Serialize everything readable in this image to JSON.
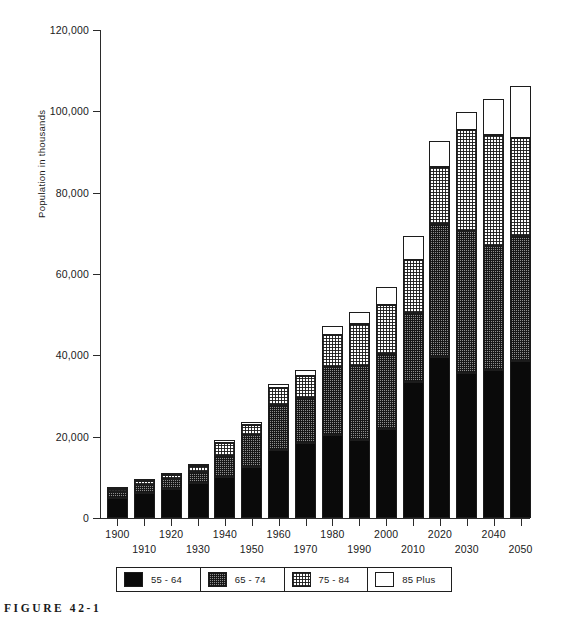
{
  "figure": {
    "caption": "FIGURE 42-1"
  },
  "chart_data": {
    "type": "bar",
    "subtype": "stacked-vertical",
    "title": "",
    "xlabel": "",
    "ylabel": "Population in thousands",
    "ylim": [
      0,
      120000
    ],
    "ytick_values": [
      0,
      20000,
      40000,
      60000,
      80000,
      100000,
      120000
    ],
    "ytick_labels": [
      "0",
      "20,000",
      "40,000",
      "60,000",
      "80,000",
      "100,000",
      "120,000"
    ],
    "grid": false,
    "legend_position": "bottom",
    "categories": [
      "1900",
      "1910",
      "1920",
      "1930",
      "1940",
      "1950",
      "1960",
      "1970",
      "1980",
      "1990",
      "2000",
      "2010",
      "2020",
      "2030",
      "2040",
      "2050"
    ],
    "series": [
      {
        "name": "55 - 64",
        "fill": "solid-black",
        "color": "#0a0a0a",
        "values": [
          4900,
          6100,
          7200,
          8500,
          10100,
          12500,
          16800,
          18500,
          20300,
          19300,
          21900,
          33400,
          39600,
          35600,
          36400,
          38500
        ]
      },
      {
        "name": "65 - 74",
        "fill": "dark-checker",
        "color": "#8e8e8e",
        "values": [
          1600,
          2000,
          2400,
          2700,
          5200,
          8000,
          11000,
          11100,
          16900,
          18200,
          18400,
          17100,
          32700,
          35100,
          30400,
          30800
        ]
      },
      {
        "name": "75 - 84",
        "fill": "light-dotted",
        "color": "#ffffff",
        "values": [
          700,
          900,
          1100,
          1500,
          3100,
          2400,
          4200,
          5300,
          7700,
          10100,
          12200,
          13000,
          14100,
          24700,
          27500,
          24100
        ]
      },
      {
        "name": "85 Plus",
        "fill": "open-white",
        "color": "#ffffff",
        "values": [
          250,
          350,
          450,
          600,
          900,
          600,
          900,
          1400,
          2200,
          3100,
          4300,
          5900,
          6400,
          4500,
          8700,
          12800
        ]
      }
    ],
    "totals": [
      7450,
      9350,
      11150,
      13300,
      19300,
      23500,
      32900,
      36300,
      47100,
      50700,
      56800,
      69400,
      92800,
      99900,
      103000,
      106200
    ]
  },
  "legend": {
    "items": [
      {
        "label": "55 - 64",
        "swatch": "solid-black"
      },
      {
        "label": "65 - 74",
        "swatch": "dark-checker"
      },
      {
        "label": "75 - 84",
        "swatch": "light-dotted"
      },
      {
        "label": "85 Plus",
        "swatch": "open-white"
      }
    ]
  }
}
